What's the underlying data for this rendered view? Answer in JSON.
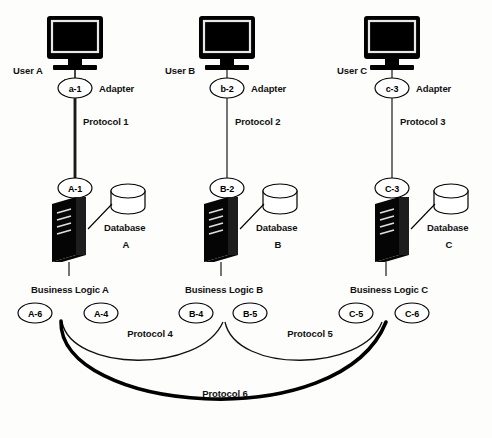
{
  "diagram": {
    "background_color": "#fdfdfc",
    "line_color": "#111111",
    "columns": [
      {
        "id": "a",
        "user_label": "User A",
        "adapter_node": "a-1",
        "adapter_label": "Adapter",
        "protocol_label": "Protocol 1",
        "protocol_emphasis": "thick",
        "server_node": "A-1",
        "database_label": "Database",
        "database_letter": "A",
        "business_logic_label": "Business Logic A",
        "logic_nodes": [
          "A-6",
          "A-4"
        ]
      },
      {
        "id": "b",
        "user_label": "User B",
        "adapter_node": "b-2",
        "adapter_label": "Adapter",
        "protocol_label": "Protocol 2",
        "protocol_emphasis": "thin",
        "server_node": "B-2",
        "database_label": "Database",
        "database_letter": "B",
        "business_logic_label": "Business Logic B",
        "logic_nodes": [
          "B-4",
          "B-5"
        ]
      },
      {
        "id": "c",
        "user_label": "User C",
        "adapter_node": "c-3",
        "adapter_label": "Adapter",
        "protocol_label": "Protocol 3",
        "protocol_emphasis": "thin",
        "server_node": "C-3",
        "database_label": "Database",
        "database_letter": "C",
        "business_logic_label": "Business Logic C",
        "logic_nodes": [
          "C-5",
          "C-6"
        ]
      }
    ],
    "cross_protocols": [
      {
        "id": "p4",
        "label": "Protocol 4",
        "emphasis": "thin",
        "from": "A-4",
        "to": "B-4"
      },
      {
        "id": "p5",
        "label": "Protocol 5",
        "emphasis": "thin",
        "from": "B-5",
        "to": "C-5"
      },
      {
        "id": "p6",
        "label": "Protocol 6",
        "emphasis": "thick",
        "from": "A-6",
        "to": "C-6"
      }
    ],
    "caption_partial": ""
  }
}
